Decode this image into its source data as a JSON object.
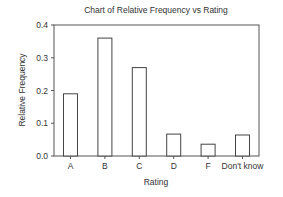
{
  "chart_data": {
    "type": "bar",
    "title": "Chart of Relative Frequency vs Rating",
    "xlabel": "Rating",
    "ylabel": "Relative Frequency",
    "categories": [
      "A",
      "B",
      "C",
      "D",
      "F",
      "Don't know"
    ],
    "values": [
      0.19,
      0.36,
      0.27,
      0.067,
      0.036,
      0.064
    ],
    "ylim": [
      0.0,
      0.4
    ],
    "yticks": [
      0.0,
      0.1,
      0.2,
      0.3,
      0.4
    ],
    "ytick_labels": [
      "0.0",
      "0.1",
      "0.2",
      "0.3",
      "0.4"
    ],
    "grid": false,
    "legend": "none",
    "bar_fill": "#ffffff",
    "bar_stroke": "#444444"
  }
}
